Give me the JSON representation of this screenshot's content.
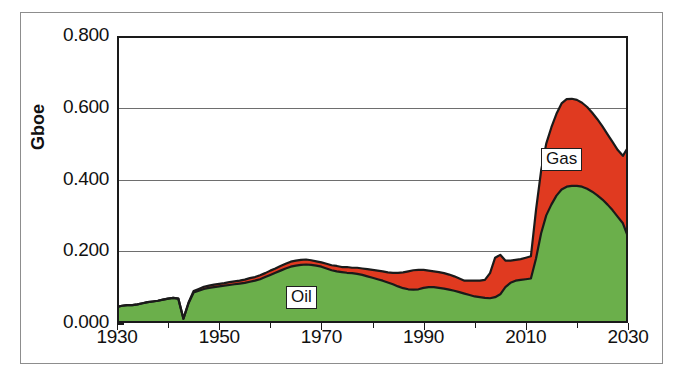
{
  "figure": {
    "yaxis_title": "Gboe",
    "ytick_labels": [
      "0.000",
      "0.200",
      "0.400",
      "0.600",
      "0.800"
    ],
    "xtick_labels": [
      "1930",
      "1950",
      "1970",
      "1990",
      "2010",
      "2030"
    ],
    "series_labels": {
      "oil": "Oil",
      "gas": "Gas"
    },
    "colors": {
      "oil": "#6BAF4B",
      "gas": "#E03A20",
      "outline": "#1a1a1a",
      "gridline": "#6e6e6e",
      "frame": "#8d8d8d",
      "background": "#ffffff"
    }
  },
  "chart_data": {
    "type": "area",
    "stacked": true,
    "title": "",
    "xlabel": "",
    "ylabel": "Gboe",
    "xlim": [
      1930,
      2030
    ],
    "ylim": [
      0.0,
      0.8
    ],
    "xticks": [
      1930,
      1950,
      1970,
      1990,
      2010,
      2030
    ],
    "yticks": [
      0.0,
      0.2,
      0.4,
      0.6,
      0.8
    ],
    "minor_xticks": [
      1940,
      1960,
      1980,
      2000,
      2020
    ],
    "grid": true,
    "grid_axis": "y",
    "legend_position": "inline-labels",
    "x": [
      1930,
      1931,
      1932,
      1933,
      1934,
      1935,
      1936,
      1937,
      1938,
      1939,
      1940,
      1941,
      1942,
      1943,
      1944,
      1945,
      1946,
      1947,
      1948,
      1949,
      1950,
      1951,
      1952,
      1953,
      1954,
      1955,
      1956,
      1957,
      1958,
      1959,
      1960,
      1961,
      1962,
      1963,
      1964,
      1965,
      1966,
      1967,
      1968,
      1969,
      1970,
      1971,
      1972,
      1973,
      1974,
      1975,
      1976,
      1977,
      1978,
      1979,
      1980,
      1981,
      1982,
      1983,
      1984,
      1985,
      1986,
      1987,
      1988,
      1989,
      1990,
      1991,
      1992,
      1993,
      1994,
      1995,
      1996,
      1997,
      1998,
      1999,
      2000,
      2001,
      2002,
      2003,
      2004,
      2005,
      2006,
      2007,
      2008,
      2009,
      2010,
      2011,
      2012,
      2013,
      2014,
      2015,
      2016,
      2017,
      2018,
      2019,
      2020,
      2021,
      2022,
      2023,
      2024,
      2025,
      2026,
      2027,
      2028,
      2029,
      2030
    ],
    "series": [
      {
        "name": "Oil",
        "color": "#6BAF4B",
        "values": [
          0.045,
          0.048,
          0.05,
          0.05,
          0.052,
          0.055,
          0.058,
          0.06,
          0.062,
          0.065,
          0.068,
          0.07,
          0.068,
          0.012,
          0.055,
          0.085,
          0.09,
          0.095,
          0.098,
          0.1,
          0.102,
          0.104,
          0.106,
          0.108,
          0.11,
          0.112,
          0.115,
          0.118,
          0.122,
          0.128,
          0.134,
          0.14,
          0.146,
          0.152,
          0.157,
          0.16,
          0.162,
          0.163,
          0.162,
          0.16,
          0.157,
          0.152,
          0.147,
          0.144,
          0.142,
          0.14,
          0.139,
          0.137,
          0.134,
          0.13,
          0.126,
          0.122,
          0.118,
          0.113,
          0.108,
          0.102,
          0.097,
          0.094,
          0.093,
          0.094,
          0.098,
          0.1,
          0.1,
          0.098,
          0.096,
          0.093,
          0.09,
          0.086,
          0.082,
          0.078,
          0.074,
          0.072,
          0.07,
          0.069,
          0.072,
          0.08,
          0.1,
          0.112,
          0.118,
          0.12,
          0.122,
          0.124,
          0.18,
          0.25,
          0.3,
          0.33,
          0.355,
          0.372,
          0.38,
          0.382,
          0.382,
          0.38,
          0.374,
          0.366,
          0.356,
          0.344,
          0.33,
          0.314,
          0.296,
          0.278,
          0.24
        ]
      },
      {
        "name": "Gas",
        "color": "#E03A20",
        "values": [
          0.0,
          0.0,
          0.0,
          0.0,
          0.0,
          0.0,
          0.0,
          0.0,
          0.0,
          0.0,
          0.0,
          0.0,
          0.0,
          0.0,
          0.002,
          0.004,
          0.005,
          0.006,
          0.006,
          0.007,
          0.007,
          0.007,
          0.008,
          0.008,
          0.008,
          0.009,
          0.01,
          0.01,
          0.011,
          0.011,
          0.012,
          0.012,
          0.013,
          0.013,
          0.014,
          0.014,
          0.014,
          0.014,
          0.013,
          0.012,
          0.012,
          0.013,
          0.014,
          0.015,
          0.014,
          0.016,
          0.015,
          0.017,
          0.018,
          0.02,
          0.022,
          0.024,
          0.026,
          0.028,
          0.032,
          0.038,
          0.044,
          0.05,
          0.054,
          0.054,
          0.05,
          0.046,
          0.044,
          0.044,
          0.043,
          0.042,
          0.04,
          0.038,
          0.036,
          0.04,
          0.044,
          0.046,
          0.05,
          0.07,
          0.11,
          0.11,
          0.074,
          0.062,
          0.058,
          0.058,
          0.06,
          0.062,
          0.135,
          0.175,
          0.2,
          0.215,
          0.228,
          0.24,
          0.244,
          0.243,
          0.24,
          0.234,
          0.228,
          0.22,
          0.212,
          0.204,
          0.196,
          0.19,
          0.186,
          0.188,
          0.25
        ]
      }
    ]
  }
}
